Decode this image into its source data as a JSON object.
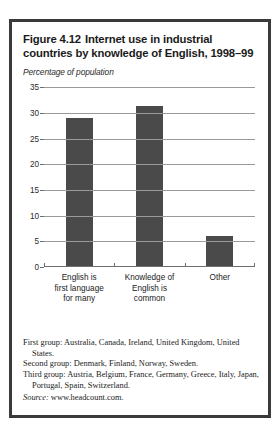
{
  "figure": {
    "number": "Figure 4.12",
    "title": "Internet use in industrial countries by knowledge of English, 1998–99",
    "subtitle": "Percentage of population"
  },
  "notes": {
    "first_group": "First group: Australia, Canada, Ireland, United Kingdom, United States.",
    "second_group": "Second group: Denmark, Finland, Norway, Sweden.",
    "third_group": "Third group: Austria, Belgium, France, Germany, Greece, Italy, Japan, Portugal, Spain, Switzerland.",
    "source_label": "Source:",
    "source_value": "www.headcount.com."
  },
  "colors": {
    "bar": "#4a4a4a",
    "border": "#3a3a3a",
    "gridline": "#9a9a9a",
    "axis": "#6f6f6f",
    "text": "#1b1b1b"
  },
  "chart_data": {
    "type": "bar",
    "subtitle": "Percentage of population",
    "categories": [
      "English is first language for many",
      "Knowledge of English is common",
      "Other"
    ],
    "category_lines": [
      [
        "English is",
        "first language",
        "for many"
      ],
      [
        "Knowledge of",
        "English is",
        "common"
      ],
      [
        "Other"
      ]
    ],
    "values": [
      28.8,
      31.2,
      5.8
    ],
    "xlabel": "",
    "ylabel": "Percentage of population",
    "ylim": [
      0,
      35
    ],
    "yticks": [
      0,
      5,
      10,
      15,
      20,
      25,
      30,
      35
    ],
    "ytick_labels": [
      "0",
      "5",
      "10",
      "15",
      "20",
      "25",
      "30",
      "35"
    ],
    "grid": true,
    "legend": false
  }
}
